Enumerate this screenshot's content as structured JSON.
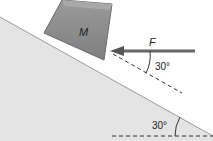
{
  "diagram": {
    "block_label": "M",
    "force_label": "F",
    "force_angle_label": "30°",
    "incline_angle_label": "30°",
    "colors": {
      "incline_fill": "#e4e4e4",
      "block_fill": "#8f8f8f",
      "block_edge": "#6a6a6a",
      "arrow": "#666666",
      "dashed": "#333333"
    }
  }
}
